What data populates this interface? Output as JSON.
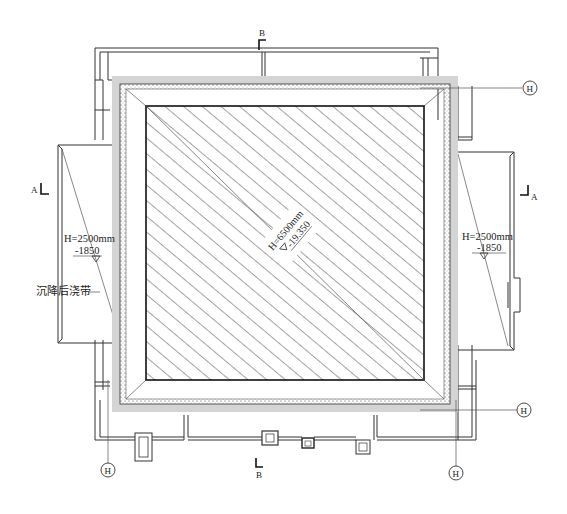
{
  "drawing": {
    "type": "foundation-pit plan (architectural)",
    "colors": {
      "line": "#333333",
      "band": "#d4d4d4",
      "hatch": "#333333",
      "background": "#ffffff"
    }
  },
  "section_marks": {
    "top": "B",
    "bottom": "B",
    "left": "A",
    "right": "A"
  },
  "grid_markers": {
    "top_right": "H",
    "bottom_right": "H",
    "bottom_left": "H",
    "bottom_center_right": "H"
  },
  "annotations": {
    "center_depth": "H=6500mm",
    "center_level": "-19.350",
    "left_depth": "H=2500mm",
    "left_level": "-1850",
    "right_depth": "H=2500mm",
    "right_level": "-1850",
    "left_label": "沉降后浇带"
  }
}
